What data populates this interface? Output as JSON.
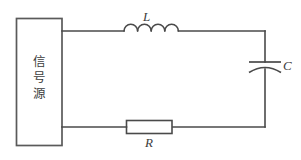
{
  "diagram": {
    "type": "series-RLC-circuit-schematic",
    "background_color": "#ffffff",
    "line_color": "#4a4a4a",
    "source": {
      "shape": "rectangle",
      "label_characters": [
        "信",
        "号",
        "源"
      ],
      "label_text": "信号源",
      "label_meaning": "signal source",
      "orientation": "vertical-text"
    },
    "components": [
      {
        "id": "inductor",
        "label": "L",
        "symbol": "coil",
        "coil_count": 4,
        "position": "top-branch",
        "label_position": "above"
      },
      {
        "id": "capacitor",
        "label": "C",
        "symbol": "curved-plate-capacitor",
        "position": "right-branch",
        "label_position": "right"
      },
      {
        "id": "resistor",
        "label": "R",
        "symbol": "rectangle",
        "position": "bottom-branch",
        "label_position": "below"
      }
    ]
  }
}
